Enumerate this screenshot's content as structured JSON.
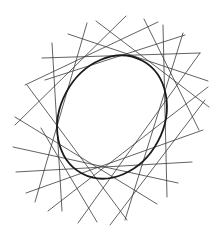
{
  "diagram": {
    "type": "ellipse-tangent-envelope",
    "background": "#ffffff",
    "line_color": "#3a3a3a",
    "ellipse_color": "#1a1a1a",
    "ellipse": {
      "cx": 112,
      "cy": 117,
      "rx": 52,
      "ry": 64,
      "rotation": 28
    },
    "tangent_lines": [
      {
        "x1": 42,
        "y1": 58,
        "x2": 200,
        "y2": 53
      },
      {
        "x1": 52,
        "y1": 43,
        "x2": 62,
        "y2": 211
      },
      {
        "x1": 87,
        "y1": 23,
        "x2": 35,
        "y2": 202
      },
      {
        "x1": 68,
        "y1": 34,
        "x2": 208,
        "y2": 81
      },
      {
        "x1": 96,
        "y1": 21,
        "x2": 209,
        "y2": 107
      },
      {
        "x1": 126,
        "y1": 16,
        "x2": 15,
        "y2": 125
      },
      {
        "x1": 144,
        "y1": 19,
        "x2": 199,
        "y2": 130
      },
      {
        "x1": 163,
        "y1": 25,
        "x2": 167,
        "y2": 197
      },
      {
        "x1": 183,
        "y1": 33,
        "x2": 125,
        "y2": 220
      },
      {
        "x1": 200,
        "y1": 53,
        "x2": 78,
        "y2": 223
      },
      {
        "x1": 208,
        "y1": 87,
        "x2": 48,
        "y2": 211
      },
      {
        "x1": 203,
        "y1": 130,
        "x2": 26,
        "y2": 193
      },
      {
        "x1": 192,
        "y1": 162,
        "x2": 16,
        "y2": 172
      },
      {
        "x1": 178,
        "y1": 183,
        "x2": 13,
        "y2": 147
      },
      {
        "x1": 157,
        "y1": 204,
        "x2": 15,
        "y2": 117
      },
      {
        "x1": 127,
        "y1": 220,
        "x2": 27,
        "y2": 85
      },
      {
        "x1": 97,
        "y1": 222,
        "x2": 41,
        "y2": 128
      },
      {
        "x1": 158,
        "y1": 22,
        "x2": 25,
        "y2": 85
      },
      {
        "x1": 185,
        "y1": 35,
        "x2": 45,
        "y2": 80
      },
      {
        "x1": 205,
        "y1": 100,
        "x2": 110,
        "y2": 225
      }
    ]
  }
}
